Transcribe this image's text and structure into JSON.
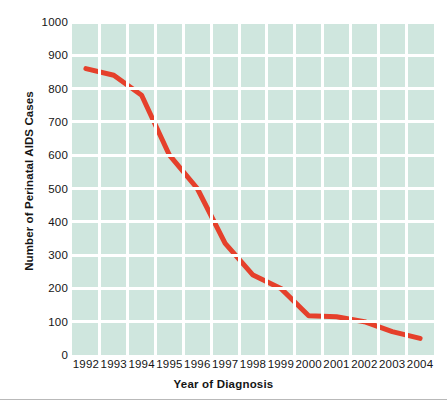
{
  "chart_data": {
    "type": "line",
    "title": "",
    "subtitle": "",
    "xlabel": "Year of Diagnosis",
    "ylabel": "Number of Perinatal AIDS Cases",
    "categories": [
      "1992",
      "1993",
      "1994",
      "1995",
      "1996",
      "1997",
      "1998",
      "1999",
      "2000",
      "2001",
      "2002",
      "2003",
      "2004"
    ],
    "x": [
      1992,
      1993,
      1994,
      1995,
      1996,
      1997,
      1998,
      1999,
      2000,
      2001,
      2002,
      2003,
      2004
    ],
    "values": [
      860,
      840,
      780,
      600,
      500,
      335,
      240,
      200,
      118,
      115,
      100,
      70,
      50
    ],
    "series": [
      {
        "name": "Perinatal AIDS Cases",
        "values": [
          860,
          840,
          780,
          600,
          500,
          335,
          240,
          200,
          118,
          115,
          100,
          70,
          50
        ]
      }
    ],
    "ylim": [
      0,
      1000
    ],
    "ytick_labels": [
      "0",
      "100",
      "200",
      "300",
      "400",
      "500",
      "600",
      "700",
      "800",
      "900",
      "1000"
    ],
    "ytick_values": [
      0,
      100,
      200,
      300,
      400,
      500,
      600,
      700,
      800,
      900,
      1000
    ],
    "xtick_labels": [
      "1992",
      "1993",
      "1994",
      "1995",
      "1996",
      "1997",
      "1998",
      "1999",
      "2000",
      "2001",
      "2002",
      "2003",
      "2004"
    ],
    "grid": true,
    "grid_color": "#ffffff",
    "legend": false,
    "legend_position": "none",
    "line_color": "#e5402b",
    "plot_background": "#cfe6de",
    "figure_background": "#ffffff",
    "markers": false,
    "line_width": 5
  }
}
